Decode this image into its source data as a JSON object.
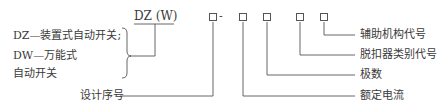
{
  "diagram": {
    "model_code": "DZ (W)",
    "type_legend": {
      "line1": "DZ—装置式自动开关;",
      "line2": "DW—万能式",
      "line3": "自动开关"
    },
    "dash": "-",
    "fields": [
      {
        "id": "design_serial",
        "label": "设计序号"
      },
      {
        "id": "rated_current",
        "label": "额定电流"
      },
      {
        "id": "poles",
        "label": "极数"
      },
      {
        "id": "release_type_code",
        "label": "脱扣器类别代号"
      },
      {
        "id": "auxiliary_mechanism_code",
        "label": "辅助机构代号"
      }
    ]
  }
}
